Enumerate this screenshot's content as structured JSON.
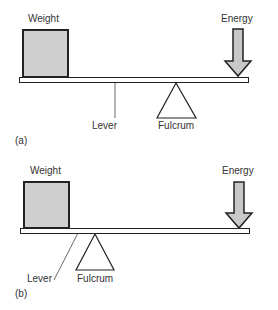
{
  "panels": [
    {
      "id": "a",
      "caption": "(a)",
      "labels": {
        "weight": "Weight",
        "energy": "Energy",
        "lever": "Lever",
        "fulcrum": "Fulcrum"
      }
    },
    {
      "id": "b",
      "caption": "(b)",
      "labels": {
        "weight": "Weight",
        "energy": "Energy",
        "lever": "Lever",
        "fulcrum": "Fulcrum"
      }
    }
  ],
  "colors": {
    "weight_fill": "#cfcfcf",
    "arrow_fill": "#c8c8c8",
    "stroke": "#222222",
    "lever_fill": "#ffffff"
  }
}
